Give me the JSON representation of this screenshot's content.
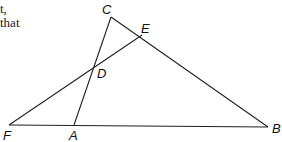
{
  "text_fragments": [
    {
      "text": "t,",
      "x": 0,
      "y": 2
    },
    {
      "text": "that",
      "x": 0,
      "y": 16
    }
  ],
  "diagram": {
    "points": {
      "C": {
        "x": 111,
        "y": 17,
        "label": "C",
        "lx": 102,
        "ly": 14
      },
      "E": {
        "x": 142,
        "y": 35,
        "label": "E",
        "lx": 141,
        "ly": 33
      },
      "D": {
        "x": 95,
        "y": 67,
        "label": "D",
        "lx": 97,
        "ly": 78
      },
      "F": {
        "x": 9,
        "y": 125,
        "label": "F",
        "lx": 3,
        "ly": 140
      },
      "A": {
        "x": 74,
        "y": 125,
        "label": "A",
        "lx": 69,
        "ly": 140
      },
      "B": {
        "x": 268,
        "y": 127,
        "label": "B",
        "lx": 272,
        "ly": 133
      }
    },
    "segments": [
      [
        "F",
        "B"
      ],
      [
        "C",
        "B"
      ],
      [
        "C",
        "A"
      ],
      [
        "F",
        "E"
      ]
    ],
    "stroke_color": "#222222"
  }
}
